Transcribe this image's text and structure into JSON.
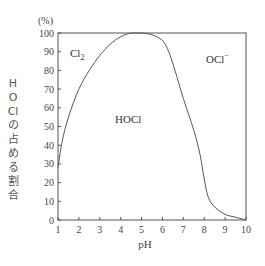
{
  "chart_data": {
    "type": "line",
    "title": "",
    "xlabel": "pH",
    "ylabel": "HOClの占める割合",
    "yunit": "(%)",
    "xlim": [
      1,
      10
    ],
    "ylim": [
      0,
      100
    ],
    "x_ticks": [
      1,
      2,
      3,
      4,
      5,
      6,
      7,
      8,
      9,
      10
    ],
    "y_ticks": [
      0,
      10,
      20,
      30,
      40,
      50,
      60,
      70,
      80,
      90,
      100
    ],
    "grid": false,
    "legend": null,
    "series": [
      {
        "name": "HOCl",
        "x": [
          1.0,
          1.2,
          1.5,
          2.0,
          2.5,
          3.0,
          3.5,
          4.0,
          4.5,
          5.0,
          5.5,
          6.0,
          6.3,
          6.6,
          7.0,
          7.5,
          7.8,
          8.0,
          8.2,
          8.5,
          9.0,
          9.5,
          10.0
        ],
        "values": [
          28,
          42,
          55,
          70,
          80,
          88,
          94,
          98,
          100,
          100,
          99,
          96,
          90,
          80,
          65,
          48,
          35,
          22,
          12,
          7,
          3,
          1.5,
          0
        ]
      }
    ],
    "annotations": [
      {
        "text": "Cl",
        "sub": "2",
        "x": 2.0,
        "y": 88
      },
      {
        "text": "HOCl",
        "x": 3.7,
        "y": 55
      },
      {
        "text": "OCl",
        "sup": "−",
        "x": 8.6,
        "y": 86
      }
    ]
  },
  "labels": {
    "yunit": "(%)",
    "xlabel": "pH",
    "ylabel": "HOClの占める割合",
    "cl2_main": "Cl",
    "cl2_sub": "2",
    "hocl": "HOCl",
    "ocl_main": "OCl",
    "ocl_sup": "−"
  },
  "colors": {
    "line": "#555555",
    "axis": "#555555",
    "text": "#444444"
  }
}
